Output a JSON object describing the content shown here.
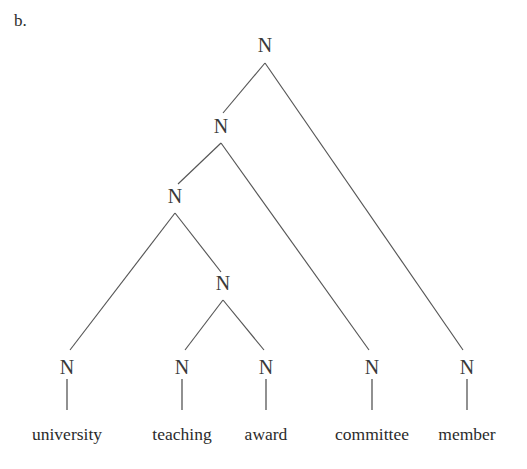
{
  "figure": {
    "item_label": "b.",
    "caption": "",
    "width": 527,
    "height": 469,
    "background_color": "#ffffff",
    "line_color": "#555555",
    "text_color": "#2b2b2b"
  },
  "tree": {
    "node_label_text": "N",
    "nodes": [
      {
        "id": "n-root",
        "label": "N",
        "x": 265,
        "y": 45,
        "level": 0
      },
      {
        "id": "n-level2",
        "label": "N",
        "x": 221,
        "y": 126,
        "level": 1
      },
      {
        "id": "n-level3",
        "label": "N",
        "x": 175,
        "y": 196,
        "level": 2
      },
      {
        "id": "n-level4",
        "label": "N",
        "x": 223,
        "y": 283,
        "level": 3
      },
      {
        "id": "n-leaf-university",
        "label": "N",
        "x": 67,
        "y": 367,
        "level": 4
      },
      {
        "id": "n-leaf-teaching",
        "label": "N",
        "x": 182,
        "y": 367,
        "level": 4
      },
      {
        "id": "n-leaf-award",
        "label": "N",
        "x": 266,
        "y": 367,
        "level": 4
      },
      {
        "id": "n-leaf-committee",
        "label": "N",
        "x": 372,
        "y": 367,
        "level": 4
      },
      {
        "id": "n-leaf-member",
        "label": "N",
        "x": 467,
        "y": 367,
        "level": 4
      }
    ],
    "branches": [
      {
        "id": "branch-root-left",
        "x1": 265,
        "y1": 63,
        "x2": 223,
        "y2": 113
      },
      {
        "id": "branch-root-right",
        "x1": 265,
        "y1": 63,
        "x2": 463,
        "y2": 350
      },
      {
        "id": "branch-l2-left",
        "x1": 221,
        "y1": 143,
        "x2": 178,
        "y2": 184
      },
      {
        "id": "branch-l2-right",
        "x1": 221,
        "y1": 143,
        "x2": 369,
        "y2": 350
      },
      {
        "id": "branch-l3-left",
        "x1": 175,
        "y1": 213,
        "x2": 70,
        "y2": 350
      },
      {
        "id": "branch-l3-right",
        "x1": 175,
        "y1": 213,
        "x2": 221,
        "y2": 272
      },
      {
        "id": "branch-l4-left",
        "x1": 223,
        "y1": 300,
        "x2": 185,
        "y2": 350
      },
      {
        "id": "branch-l4-right",
        "x1": 223,
        "y1": 300,
        "x2": 264,
        "y2": 350
      }
    ],
    "stems": [
      {
        "id": "stem-university",
        "x": 67,
        "y1": 379,
        "y2": 410
      },
      {
        "id": "stem-teaching",
        "x": 182,
        "y1": 379,
        "y2": 410
      },
      {
        "id": "stem-award",
        "x": 266,
        "y1": 379,
        "y2": 410
      },
      {
        "id": "stem-committee",
        "x": 372,
        "y1": 379,
        "y2": 410
      },
      {
        "id": "stem-member",
        "x": 467,
        "y1": 379,
        "y2": 410
      }
    ],
    "leaves": [
      {
        "id": "leaf-word-university",
        "word": "university",
        "x": 67,
        "y": 440
      },
      {
        "id": "leaf-word-teaching",
        "word": "teaching",
        "x": 182,
        "y": 440
      },
      {
        "id": "leaf-word-award",
        "word": "award",
        "x": 266,
        "y": 440
      },
      {
        "id": "leaf-word-committee",
        "word": "committee",
        "x": 372,
        "y": 440
      },
      {
        "id": "leaf-word-member",
        "word": "member",
        "x": 467,
        "y": 440
      }
    ],
    "phrase": "university teaching award committee member"
  }
}
